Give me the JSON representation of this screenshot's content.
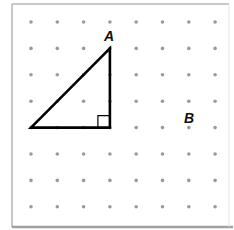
{
  "diagram": {
    "type": "dot-grid-geometry",
    "grid": {
      "columns": 8,
      "rows": 8,
      "origin_x": 31,
      "origin_y": 22,
      "spacing_x": 26.3,
      "spacing_y": 26.4,
      "dot_color": "#9a9a9a"
    },
    "frame": {
      "left": 12,
      "top": 4,
      "right": 229,
      "bottom": 227,
      "border_color": "#b5b5b5"
    },
    "triangle": {
      "vertices": [
        [
          0,
          4
        ],
        [
          3,
          4
        ],
        [
          3,
          1
        ]
      ],
      "stroke_color": "#000000",
      "right_angle_at": [
        3,
        4
      ]
    },
    "labels": [
      {
        "text": "A",
        "x": 104,
        "y": 41
      },
      {
        "text": "B",
        "x": 184,
        "y": 123
      }
    ]
  }
}
